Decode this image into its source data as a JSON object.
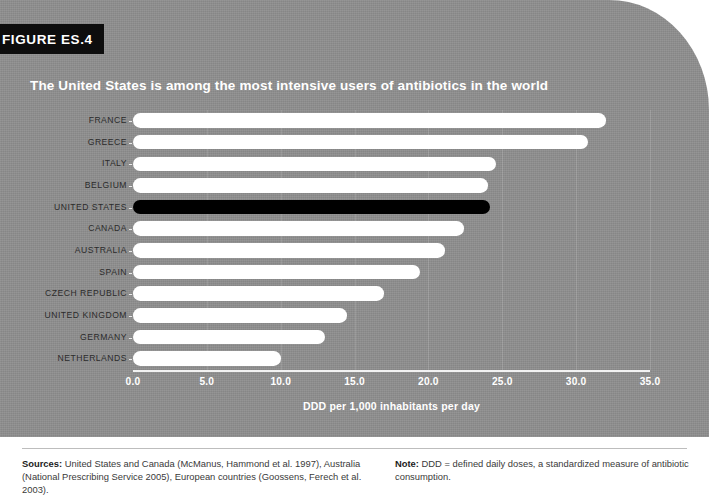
{
  "figure": {
    "tab_label": "FIGURE ES.4",
    "title": "The United States is among the most intensive users of antibiotics in the world"
  },
  "colors": {
    "panel_background": "#8e8e8e",
    "bar_default": "#ffffff",
    "bar_highlight": "#000000",
    "tab_background": "#0d0d0d",
    "axis_line": "#f2f2f2",
    "label_text": "#2b2b2b"
  },
  "footer": {
    "sources_label": "Sources:",
    "sources_text": "United States and Canada (McManus, Hammond et al. 1997), Australia (National Prescribing Service 2005), European countries (Goossens, Ferech et al. 2003).",
    "note_label": "Note:",
    "note_text": "DDD = defined daily doses, a standardized measure of antibiotic consumption."
  },
  "chart_data": {
    "type": "bar",
    "orientation": "horizontal",
    "title": "The United States is among the most intensive users of antibiotics in the world",
    "xlabel": "DDD per 1,000 inhabitants per day",
    "ylabel": "",
    "xlim": [
      0.0,
      35.0
    ],
    "xticks": [
      0.0,
      5.0,
      10.0,
      15.0,
      20.0,
      25.0,
      30.0,
      35.0
    ],
    "xtick_labels": [
      "0.0",
      "5.0",
      "10.0",
      "15.0",
      "20.0",
      "25.0",
      "30.0",
      "35.0"
    ],
    "grid": false,
    "legend": "none",
    "highlight_category": "UNITED STATES",
    "categories": [
      "FRANCE",
      "GREECE",
      "ITALY",
      "BELGIUM",
      "UNITED STATES",
      "CANADA",
      "AUSTRALIA",
      "SPAIN",
      "CZECH REPUBLIC",
      "UNITED KINGDOM",
      "GERMANY",
      "NETHERLANDS"
    ],
    "values": [
      32.0,
      30.8,
      24.6,
      24.0,
      24.2,
      22.4,
      21.1,
      19.4,
      17.0,
      14.5,
      13.0,
      10.0
    ]
  }
}
